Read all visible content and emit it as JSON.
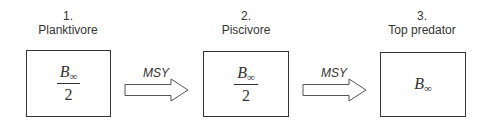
{
  "nodes": [
    {
      "number": "1.",
      "name": "Planktivore",
      "numerator": "B",
      "subscript": "∞",
      "denominator": "2"
    },
    {
      "number": "2.",
      "name": "Piscivore",
      "numerator": "B",
      "subscript": "∞",
      "denominator": "2"
    },
    {
      "number": "3.",
      "name": "Top predator",
      "value": "B",
      "subscript": "∞"
    }
  ],
  "edges": [
    {
      "from": 1,
      "to": 2,
      "label": "MSY",
      "icon": "hollow-right-arrow"
    },
    {
      "from": 2,
      "to": 3,
      "label": "MSY",
      "icon": "hollow-right-arrow"
    }
  ],
  "colors": {
    "stroke": "#333333",
    "background": "#ffffff"
  }
}
